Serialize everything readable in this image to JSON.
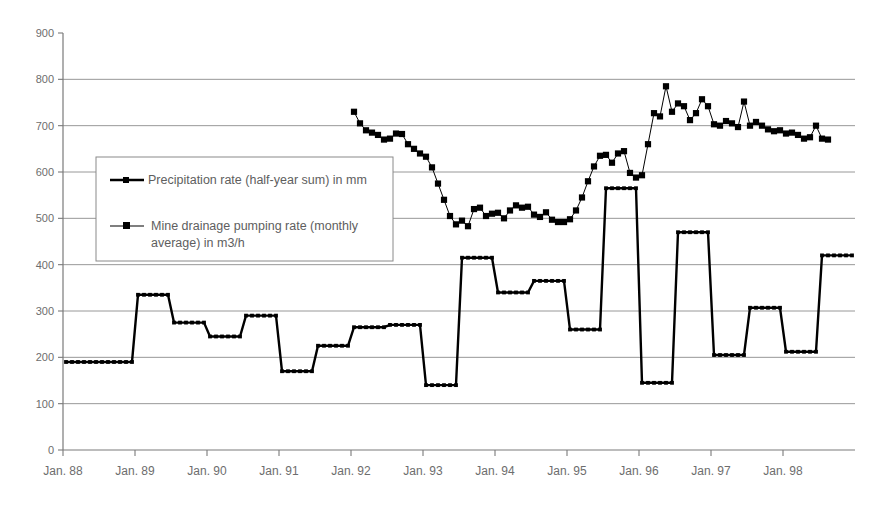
{
  "chart_data": {
    "type": "line",
    "title": "",
    "subtitle": "",
    "xlabel": "",
    "ylabel": "",
    "ylim": [
      0,
      900
    ],
    "ytick_step": 100,
    "yticks": [
      "0",
      "100",
      "200",
      "300",
      "400",
      "500",
      "600",
      "700",
      "800",
      "900"
    ],
    "xticks": [
      "Jan. 88",
      "Jan. 89",
      "Jan. 90",
      "Jan. 91",
      "Jan. 92",
      "Jan. 93",
      "Jan. 94",
      "Jan. 95",
      "Jan. 96",
      "Jan. 97",
      "Jan. 98"
    ],
    "grid": "horizontal",
    "legend_position": "inside-left-upper",
    "x_axis_unit": "month",
    "x_start": "Jan. 88",
    "x_end": "Dec. 98",
    "series": [
      {
        "name": "Precipitation rate (half-year sum) in mm",
        "marker": "square",
        "color": "#000000",
        "style": "step",
        "step_period_months": 6,
        "step_values": [
          190,
          190,
          335,
          275,
          245,
          290,
          170,
          225,
          265,
          270,
          140,
          415,
          340,
          365,
          260,
          565,
          145,
          470,
          205,
          307,
          212,
          420
        ],
        "step_labels": [
          "Jan-Jun 88",
          "Jul-Dec 88",
          "Jan-Jun 89",
          "Jul-Dec 89",
          "Jan-Jun 90",
          "Jul-Dec 90",
          "Jan-Jun 91",
          "Jul-Dec 91",
          "Jan-Jun 92",
          "Jul-Dec 92",
          "Jan-Jun 93",
          "Jul-Dec 93",
          "Jan-Jun 94",
          "Jul-Dec 94",
          "Jan-Jun 95",
          "Jul-Dec 95",
          "Jan-Jun 96",
          "Jul-Dec 96",
          "Jan-Jun 97",
          "Jul-Dec 97",
          "Jan-Jun 98",
          "Jul-Dec 98"
        ]
      },
      {
        "name": "Mine drainage pumping rate (monthly average) in m3/h",
        "marker": "square",
        "color": "#000000",
        "style": "line-markers",
        "start_month": "Jan. 92",
        "values": [
          730,
          705,
          690,
          685,
          680,
          670,
          672,
          683,
          682,
          660,
          650,
          640,
          633,
          610,
          575,
          540,
          505,
          487,
          495,
          483,
          520,
          523,
          505,
          510,
          512,
          500,
          517,
          528,
          523,
          525,
          508,
          503,
          513,
          497,
          492,
          492,
          498,
          517,
          545,
          580,
          612,
          635,
          637,
          620,
          640,
          645,
          598,
          588,
          593,
          660,
          727,
          720,
          785,
          730,
          748,
          742,
          712,
          727,
          757,
          742,
          703,
          700,
          710,
          705,
          697,
          752,
          700,
          708,
          700,
          692,
          688,
          690,
          683,
          685,
          680,
          672,
          675,
          700,
          672,
          670
        ]
      }
    ],
    "legend_entries": [
      "Precipitation rate (half-year sum) in mm",
      "Mine drainage pumping rate (monthly average) in m3/h"
    ]
  },
  "legend": {
    "entry1_line1": "Precipitation rate (half-year sum) in mm",
    "entry2_line1": "Mine drainage pumping rate (monthly",
    "entry2_line2": "average) in m3/h"
  }
}
